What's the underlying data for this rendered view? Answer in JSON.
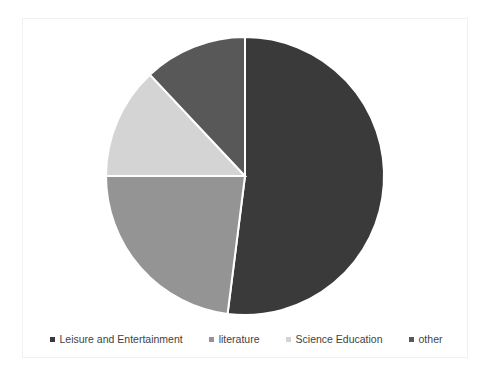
{
  "chart_data": {
    "type": "pie",
    "title": "",
    "subtitle": "",
    "xlabel": "",
    "ylabel": "",
    "grid": false,
    "legend_position": "bottom",
    "start_angle_deg": 0,
    "direction": "clockwise",
    "categories": [
      "Leisure and Entertainment",
      "literature",
      "Science Education",
      "other"
    ],
    "values": [
      52,
      23,
      13,
      12
    ],
    "unit": "%",
    "colors": [
      "#3a3a3a",
      "#949494",
      "#d4d4d4",
      "#585858"
    ],
    "slices": [
      {
        "label": "Leisure and Entertainment",
        "value": 52,
        "color": "#3a3a3a",
        "start_deg": 0,
        "end_deg": 187.2
      },
      {
        "label": "literature",
        "value": 23,
        "color": "#949494",
        "start_deg": 187.2,
        "end_deg": 270.0
      },
      {
        "label": "Science Education",
        "value": 13,
        "color": "#d4d4d4",
        "start_deg": 270.0,
        "end_deg": 316.8
      },
      {
        "label": "other",
        "value": 12,
        "color": "#585858",
        "start_deg": 316.8,
        "end_deg": 360.0
      }
    ],
    "slice_separator_color": "#ffffff",
    "background_color": "#ffffff"
  },
  "legend": {
    "items": [
      {
        "label": "Leisure and Entertainment",
        "color": "#3a3a3a"
      },
      {
        "label": "literature",
        "color": "#949494"
      },
      {
        "label": "Science Education",
        "color": "#d4d4d4"
      },
      {
        "label": "other",
        "color": "#585858"
      }
    ]
  }
}
